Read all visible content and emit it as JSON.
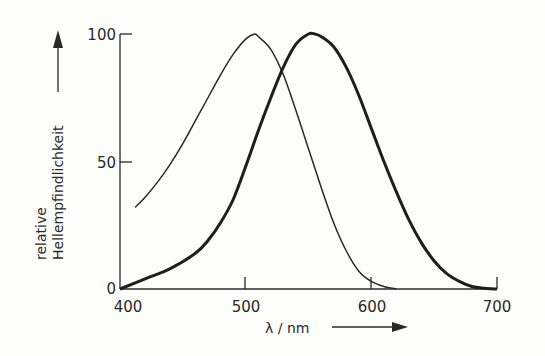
{
  "chart_data": {
    "type": "line",
    "title": "",
    "xlabel": "λ / nm",
    "ylabel": [
      "relative",
      "Hellempfindlichkeit"
    ],
    "xlim": [
      400,
      700
    ],
    "ylim": [
      0,
      100
    ],
    "x_ticks": [
      "400",
      "500",
      "600",
      "700"
    ],
    "y_ticks": [
      "0",
      "50",
      "100"
    ],
    "grid": false,
    "legend": null,
    "series": [
      {
        "name": "Skotopisches Sehen (Stäbchen)",
        "style": "thin",
        "x": [
          412,
          420,
          430,
          440,
          450,
          460,
          470,
          480,
          490,
          500,
          507,
          510,
          520,
          530,
          540,
          550,
          560,
          570,
          580,
          590,
          600,
          610,
          620
        ],
        "values": [
          32,
          36,
          42,
          49,
          57,
          66,
          75,
          84,
          92,
          98,
          100,
          99,
          94,
          84,
          70,
          55,
          40,
          26,
          15,
          7,
          3,
          1,
          0
        ]
      },
      {
        "name": "Photopisches Sehen (Zapfen)",
        "style": "thick",
        "x": [
          400,
          420,
          440,
          460,
          470,
          480,
          490,
          500,
          510,
          520,
          530,
          540,
          550,
          555,
          560,
          570,
          580,
          590,
          600,
          610,
          620,
          630,
          640,
          650,
          660,
          670,
          680,
          690,
          700
        ],
        "values": [
          0,
          4,
          8,
          14,
          19,
          26,
          35,
          48,
          62,
          75,
          87,
          96,
          100,
          100,
          99,
          95,
          87,
          76,
          63,
          50,
          38,
          27,
          18,
          11,
          6,
          3,
          1,
          0.3,
          0
        ]
      }
    ]
  }
}
